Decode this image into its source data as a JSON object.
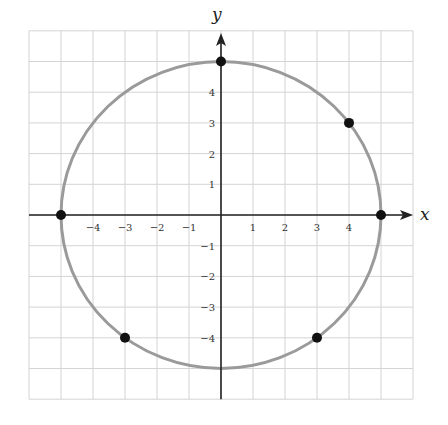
{
  "chart_data": {
    "type": "scatter",
    "title": "",
    "xlabel": "x",
    "ylabel": "y",
    "xlim": [
      -6,
      6
    ],
    "ylim": [
      -6,
      6
    ],
    "grid": true,
    "legend": null,
    "x_ticks": [
      -4,
      -3,
      -2,
      -1,
      1,
      2,
      3,
      4
    ],
    "y_ticks": [
      -4,
      -3,
      -2,
      -1,
      1,
      2,
      3,
      4
    ],
    "x_tick_labels": [
      "−4",
      "−3",
      "−2",
      "−1",
      "1",
      "2",
      "3",
      "4"
    ],
    "y_tick_labels": [
      "−4",
      "−3",
      "−2",
      "−1",
      "1",
      "2",
      "3",
      "4"
    ],
    "curve": {
      "type": "circle",
      "equation": "x^2 + y^2 = 25",
      "center": [
        0,
        0
      ],
      "radius": 5,
      "color": "#9a9a9a"
    },
    "points": [
      {
        "x": 0,
        "y": 5
      },
      {
        "x": 4,
        "y": 3
      },
      {
        "x": 5,
        "y": 0
      },
      {
        "x": -5,
        "y": 0
      },
      {
        "x": -3,
        "y": -4
      },
      {
        "x": 3,
        "y": -4
      }
    ],
    "point_color": "#111111",
    "grid_color": "#d4d4d4",
    "axis_color": "#222222"
  }
}
